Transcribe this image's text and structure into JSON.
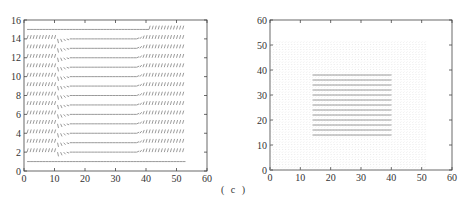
{
  "figure": {
    "caption": "( c )"
  },
  "chart_data": [
    {
      "type": "quiver",
      "title": "",
      "xlabel": "",
      "ylabel": "",
      "xlim": [
        0,
        60
      ],
      "ylim": [
        0,
        16
      ],
      "xticks": [
        0,
        10,
        20,
        30,
        40,
        50,
        60
      ],
      "yticks": [
        0,
        2,
        4,
        6,
        8,
        10,
        12,
        14,
        16
      ],
      "grid": false,
      "description": "Vector field on grid x=1..52, y=1..15; rows of mostly horizontal arrows, with diagonal/steep vectors for x<11 and x>39, transition region near x=11-15 sloping downward, bottom row y=1 horizontal across full width, top row y=15 horizontal",
      "field": {
        "x_range": [
          1,
          52
        ],
        "y_range": [
          1,
          15
        ],
        "x_step": 1,
        "y_step": 1,
        "left_steep_region": [
          1,
          11
        ],
        "right_steep_region": [
          39,
          52
        ],
        "transition_x": [
          11,
          16
        ]
      }
    },
    {
      "type": "quiver",
      "title": "",
      "xlabel": "",
      "ylabel": "",
      "xlim": [
        0,
        60
      ],
      "ylim": [
        0,
        60
      ],
      "xticks": [
        0,
        10,
        20,
        30,
        40,
        50,
        60
      ],
      "yticks": [
        0,
        10,
        20,
        30,
        40,
        50,
        60
      ],
      "grid": false,
      "description": "Dense light vector grid covering x=0..51, y=0..51 with near-zero vectors; a square region x≈14..39, y≈13..38 contains strong horizontal arrows forming rows",
      "field": {
        "x_range": [
          0,
          51
        ],
        "y_range": [
          0,
          51
        ],
        "step": 1,
        "active_region": {
          "x": [
            14,
            39
          ],
          "y": [
            13,
            38
          ]
        }
      }
    }
  ],
  "axes": {
    "left": {
      "xtick_labels": [
        "0",
        "10",
        "20",
        "30",
        "40",
        "50",
        "60"
      ],
      "ytick_labels": [
        "0",
        "2",
        "4",
        "6",
        "8",
        "10",
        "12",
        "14",
        "16"
      ]
    },
    "right": {
      "xtick_labels": [
        "0",
        "10",
        "20",
        "30",
        "40",
        "50",
        "60"
      ],
      "ytick_labels": [
        "0",
        "10",
        "20",
        "30",
        "40",
        "50",
        "60"
      ]
    }
  },
  "colors": {
    "axis": "#444444",
    "arrow_dark": "#555555",
    "arrow_light": "#bbbbbb"
  }
}
